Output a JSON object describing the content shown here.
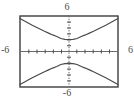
{
  "figure": {
    "title": "",
    "background_color": "#ffffff",
    "width": 134,
    "height": 101
  },
  "labels": {
    "top": "6",
    "bottom": "-6",
    "left": "-6",
    "right": "6"
  },
  "style": {
    "frame_color": "#3c3c3c",
    "curve_color": "#4a4a4a",
    "axis_color": "#555555",
    "label_color": "#4a4a4a",
    "frame_width": 1.4,
    "curve_width": 1.2,
    "axis_width": 1
  },
  "chart_data": {
    "type": "line",
    "title": "",
    "xlabel": "",
    "ylabel": "",
    "xlim": [
      -6,
      6
    ],
    "ylim": [
      -6,
      6
    ],
    "grid": false,
    "legend": null,
    "axis_ticks_visible": true,
    "x_tick_values": [
      -5,
      -4,
      -3,
      -2,
      -1,
      1,
      2,
      3,
      4,
      5
    ],
    "y_tick_values": [
      -5,
      -4,
      -3,
      -2,
      -1,
      1,
      2,
      3,
      4,
      5
    ],
    "tick_labels_shown": [
      "6",
      "-6",
      "-6",
      "6"
    ],
    "equation": "y = ±2·sqrt(1 + x²/5)",
    "series": [
      {
        "name": "upper-branch",
        "x": [
          -6,
          -5.5,
          -5,
          -4.5,
          -4,
          -3.5,
          -3,
          -2.5,
          -2,
          -1.5,
          -1,
          -0.5,
          0,
          0.5,
          1,
          1.5,
          2,
          2.5,
          3,
          3.5,
          4,
          4.5,
          5,
          5.5,
          6
        ],
        "y": [
          5.57,
          5.19,
          4.82,
          4.45,
          4.1,
          3.75,
          3.41,
          3.1,
          2.8,
          2.53,
          2.19,
          2.05,
          2.0,
          2.05,
          2.19,
          2.53,
          2.8,
          3.1,
          3.41,
          3.75,
          4.1,
          4.45,
          4.82,
          5.19,
          5.57
        ]
      },
      {
        "name": "lower-branch",
        "x": [
          -6,
          -5.5,
          -5,
          -4.5,
          -4,
          -3.5,
          -3,
          -2.5,
          -2,
          -1.5,
          -1,
          -0.5,
          0,
          0.5,
          1,
          1.5,
          2,
          2.5,
          3,
          3.5,
          4,
          4.5,
          5,
          5.5,
          6
        ],
        "y": [
          -5.57,
          -5.19,
          -4.82,
          -4.45,
          -4.1,
          -3.75,
          -3.41,
          -3.1,
          -2.8,
          -2.53,
          -2.19,
          -2.05,
          -2.0,
          -2.05,
          -2.19,
          -2.53,
          -2.8,
          -3.1,
          -3.41,
          -3.75,
          -4.1,
          -4.45,
          -4.82,
          -5.19,
          -5.57
        ]
      }
    ]
  },
  "geometry": {
    "frame_left_px": 20,
    "frame_top_px": 16,
    "frame_right_px": 118,
    "frame_bottom_px": 87,
    "origin_x_px": 69,
    "origin_y_px": 51.5
  }
}
